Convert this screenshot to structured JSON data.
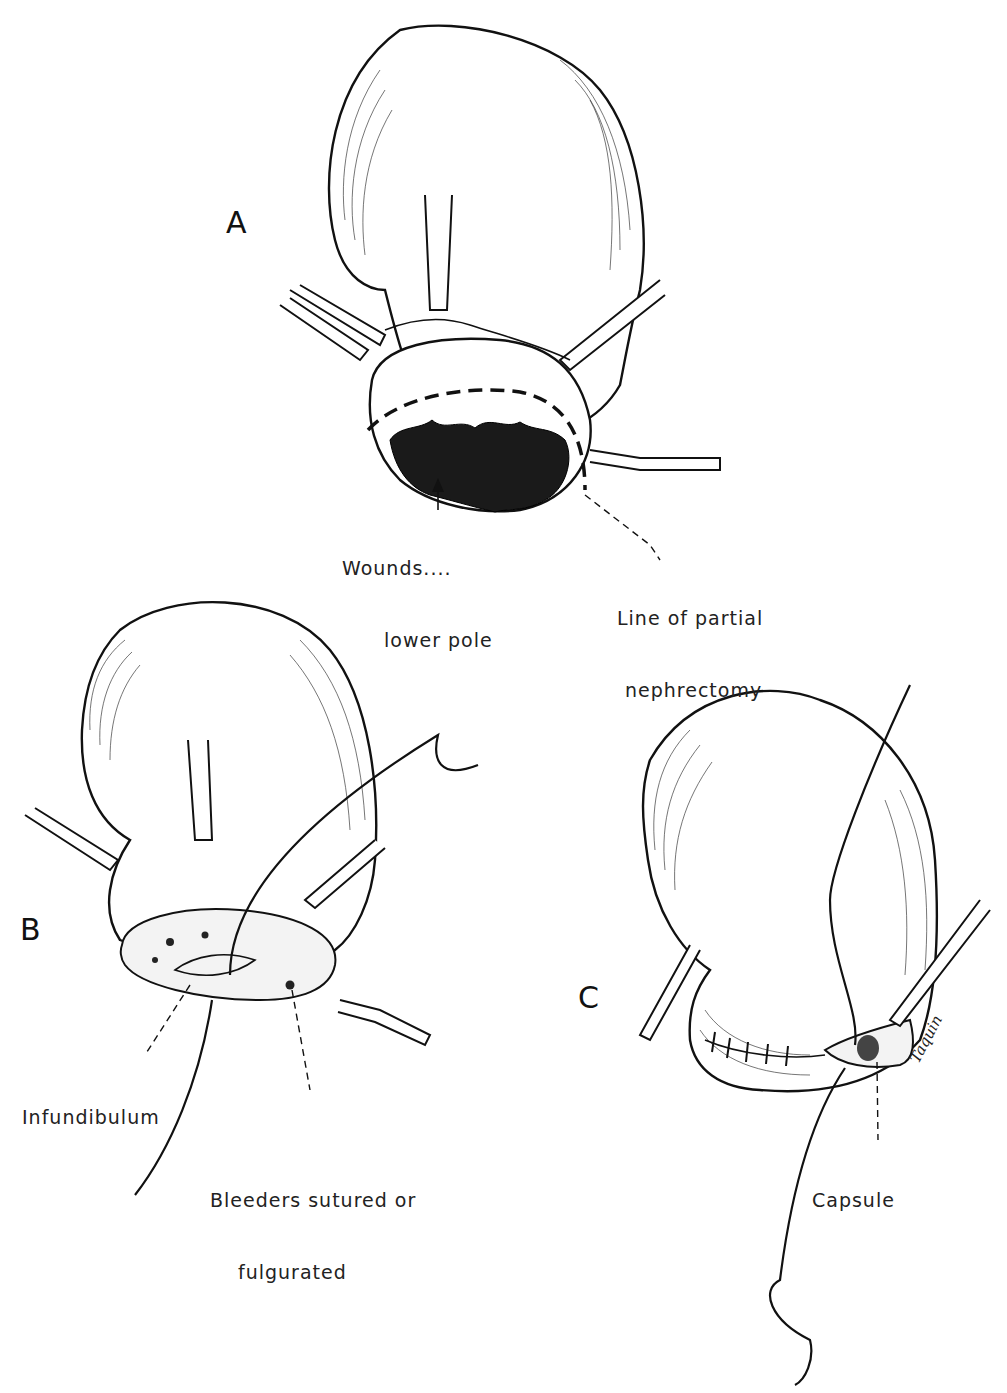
{
  "figure": {
    "panels": [
      {
        "id": "A",
        "label": "A",
        "callouts": [
          {
            "id": "wounds",
            "line1": "Wounds....",
            "line2": "lower pole"
          },
          {
            "id": "line-of-resection",
            "line1": "Line of partial",
            "line2": "nephrectomy"
          }
        ]
      },
      {
        "id": "B",
        "label": "B",
        "callouts": [
          {
            "id": "infundibulum",
            "line1": "Infundibulum"
          },
          {
            "id": "bleeders",
            "line1": "Bleeders sutured or",
            "line2": "fulgurated"
          }
        ]
      },
      {
        "id": "C",
        "label": "C",
        "callouts": [
          {
            "id": "capsule",
            "line1": "Capsule"
          }
        ],
        "signature": "Taquin"
      }
    ],
    "colors": {
      "ink": "#111111",
      "paper": "#ffffff",
      "wound": "#1a1a1a"
    }
  }
}
